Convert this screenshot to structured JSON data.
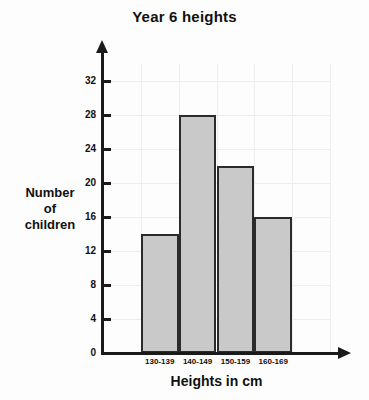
{
  "chart_data": {
    "type": "bar",
    "title": "Year 6 heights",
    "xlabel": "Heights in cm",
    "ylabel": "Number of children",
    "ylabel_lines": [
      "Number",
      "of",
      "children"
    ],
    "categories": [
      "130-139",
      "140-149",
      "150-159",
      "160-169"
    ],
    "values": [
      14,
      28,
      22,
      16
    ],
    "yticks": [
      0,
      4,
      8,
      12,
      16,
      20,
      24,
      28,
      32
    ],
    "ytick_labels": [
      "0",
      "4",
      "8",
      "12",
      "16",
      "20",
      "24",
      "28",
      "32"
    ],
    "ylim": [
      0,
      34
    ],
    "grid": true,
    "legend": false,
    "bar_fill_color": "#c9c9c9",
    "bar_edge_color": "#2b2b2b",
    "axis_color": "#1a1a1a",
    "grid_color": "#eeeeee",
    "background_color": "#fdfdfd",
    "text_color": "#111111"
  }
}
